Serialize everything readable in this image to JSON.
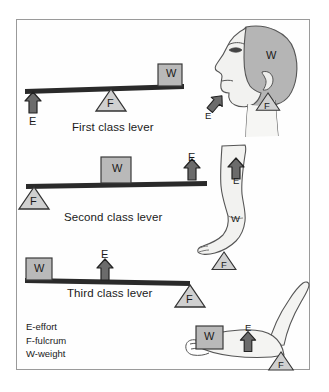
{
  "diagram": {
    "frame": {
      "border_color": "#9a9a9a",
      "background": "#fefefe"
    },
    "colors": {
      "bar": "#2a2a2a",
      "weight_block_fill": "#b9b9b9",
      "weight_block_stroke": "#3a3a3a",
      "effort_arrow_fill": "#6b6b6b",
      "effort_arrow_stroke": "#2a2a2a",
      "fulcrum_fill": "#d0d0d0",
      "fulcrum_stroke": "#3a3a3a",
      "body_fill": "#f2f2f0",
      "body_stroke": "#555555",
      "skull_fill": "#b5b5b5",
      "text": "#1a1a1a"
    },
    "symbols": {
      "effort": "E",
      "fulcrum": "F",
      "weight": "W"
    },
    "levers": [
      {
        "id": "first-class-lever",
        "caption": "First class lever",
        "order": "E – F – W",
        "effort_label": "E",
        "fulcrum_label": "F",
        "weight_label": "W"
      },
      {
        "id": "second-class-lever",
        "caption": "Second class lever",
        "order": "F – W – E",
        "effort_label": "E",
        "fulcrum_label": "F",
        "weight_label": "W"
      },
      {
        "id": "third-class-lever",
        "caption": "Third class lever",
        "order": "W – E – F",
        "effort_label": "E",
        "fulcrum_label": "F",
        "weight_label": "W"
      }
    ],
    "anatomy": [
      {
        "id": "head-neck",
        "description": "head and neck",
        "weight_label": "W",
        "fulcrum_label": "F",
        "effort_label": "E"
      },
      {
        "id": "leg-foot",
        "description": "leg standing on toes",
        "weight_label": "W",
        "fulcrum_label": "F",
        "effort_label": "E"
      },
      {
        "id": "arm-elbow",
        "description": "forearm holding weight",
        "weight_label": "W",
        "fulcrum_label": "F",
        "effort_label": "E"
      }
    ],
    "legend": {
      "effort": "E-effort",
      "fulcrum": "F-fulcrum",
      "weight": "W-weight"
    }
  }
}
